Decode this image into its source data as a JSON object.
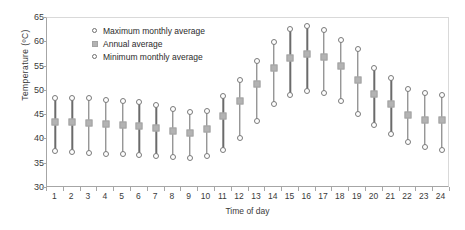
{
  "chart_data": {
    "type": "scatter",
    "title": "",
    "xlabel": "Time of day",
    "ylabel": "Temperature (ºl)",
    "ylim": [
      30,
      65
    ],
    "ytick_step": 5,
    "yticks": [
      30,
      35,
      40,
      45,
      50,
      55,
      60,
      65
    ],
    "grid": false,
    "legend_position": "upper-left-inside",
    "categories": [
      1,
      2,
      3,
      4,
      5,
      6,
      7,
      8,
      9,
      10,
      11,
      12,
      13,
      14,
      15,
      16,
      17,
      18,
      19,
      20,
      21,
      22,
      23,
      24
    ],
    "series": [
      {
        "name": "Maximum monthly average",
        "marker": "open-circle",
        "values": [
          48.6,
          48.6,
          48.5,
          48.2,
          48.0,
          47.7,
          47.0,
          46.3,
          45.6,
          45.9,
          49.0,
          52.2,
          56.2,
          60.1,
          62.7,
          63.4,
          62.5,
          60.5,
          58.6,
          54.7,
          52.7,
          50.4,
          49.5,
          49.1
        ]
      },
      {
        "name": "Annual average",
        "marker": "filled-square",
        "values": [
          43.6,
          43.5,
          43.4,
          43.2,
          43.0,
          42.8,
          42.3,
          41.8,
          41.3,
          42.1,
          44.8,
          47.9,
          51.4,
          54.8,
          56.7,
          57.5,
          56.9,
          55.1,
          52.3,
          49.4,
          47.3,
          45.0,
          44.1,
          43.9
        ]
      },
      {
        "name": "Minimum monthly average",
        "marker": "open-circle",
        "values": [
          37.6,
          37.5,
          37.3,
          37.1,
          36.9,
          36.7,
          36.5,
          36.3,
          36.1,
          36.6,
          37.8,
          40.3,
          43.8,
          47.2,
          49.2,
          49.9,
          49.6,
          47.9,
          45.2,
          42.9,
          41.1,
          39.4,
          38.4,
          37.8
        ]
      }
    ]
  },
  "axis": {
    "y_title": "Temperature (ºC)",
    "x_title": "Time of day"
  },
  "legend": {
    "items": [
      {
        "label": "Maximum monthly average",
        "marker": "open-circle-icon"
      },
      {
        "label": "Annual average",
        "marker": "gray-square-icon"
      },
      {
        "label": "Minimum monthly average",
        "marker": "open-circle-icon"
      }
    ]
  },
  "colors": {
    "marker_square": "#b3b3b3",
    "marker_outline": "#7a7a7a",
    "range_line": "#6b6b6b",
    "axis": "#a6a6a6",
    "text": "#3a3a3a"
  }
}
